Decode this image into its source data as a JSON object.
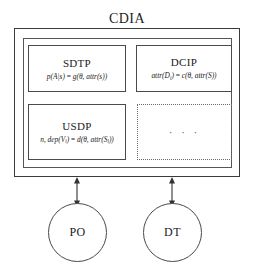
{
  "diagram": {
    "title": "CDIA",
    "type": "block-diagram",
    "container": {
      "name": "CDIA",
      "label": "CDIA"
    },
    "modules": [
      {
        "id": "sdtp",
        "title": "SDTP",
        "formula_plain": "p(A|s) = g(θ, attr(s))",
        "formula_lhs": "p(A|s)",
        "formula_rhs": "g(θ, attr(s))",
        "style": "solid"
      },
      {
        "id": "dcip",
        "title": "DCIP",
        "formula_plain": "attr(D_i) = c(θ, attr(S))",
        "formula_lhs": "attr(D",
        "formula_lhs_sub": "i",
        "formula_rhs": "c(θ, attr(S))",
        "style": "solid"
      },
      {
        "id": "usdp",
        "title": "USDP",
        "formula_plain": "n, dep(V_i) = d(θ, attr(S_i))",
        "formula_lhs": "n, dep(V",
        "formula_lhs_sub": "i",
        "formula_rhs": "d(θ, attr(S",
        "formula_rhs_sub": "i",
        "style": "solid"
      },
      {
        "id": "more",
        "title": "",
        "ellipsis": "· · ·",
        "style": "dotted"
      }
    ],
    "nodes": [
      {
        "id": "po",
        "label": "PO",
        "shape": "circle"
      },
      {
        "id": "dt",
        "label": "DT",
        "shape": "circle"
      }
    ],
    "connectors": [
      {
        "id": "cdia-po",
        "from": "CDIA",
        "to": "PO",
        "style": "double-headed-arrow"
      },
      {
        "id": "cdia-dt",
        "from": "CDIA",
        "to": "DT",
        "style": "double-headed-arrow"
      }
    ],
    "colors": {
      "background": "#ffffff",
      "stroke": "#4a4a4a",
      "outer_stroke": "#3b3b3b",
      "dotted_stroke": "#6a6a6a",
      "text": "#1a1a1a"
    }
  }
}
